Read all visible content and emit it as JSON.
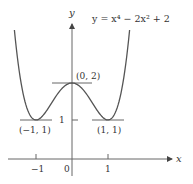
{
  "chart_data": {
    "type": "line",
    "title": "",
    "equation": "y = x⁴ − 2x² + 2",
    "xlabel": "x",
    "ylabel": "y",
    "x_ticks": [
      {
        "value": -1,
        "label": "−1"
      },
      {
        "value": 1,
        "label": "1"
      }
    ],
    "y_ticks": [
      {
        "value": 1,
        "label": "1"
      }
    ],
    "origin_label": "0",
    "xlim": [
      -1.75,
      2.8
    ],
    "ylim": [
      -0.5,
      3.7
    ],
    "grid": false,
    "series": [
      {
        "name": "y = x⁴ − 2x² + 2",
        "function": "x^4 - 2x^2 + 2",
        "domain": [
          -1.6,
          1.6
        ]
      }
    ],
    "annotations": [
      {
        "point": [
          -1,
          1
        ],
        "label": "(−1, 1)",
        "type": "local-minimum",
        "horizontal_tangent": true
      },
      {
        "point": [
          0,
          2
        ],
        "label": "(0, 2)",
        "type": "local-maximum",
        "horizontal_tangent": true
      },
      {
        "point": [
          1,
          1
        ],
        "label": "(1, 1)",
        "type": "local-minimum",
        "horizontal_tangent": true
      }
    ],
    "colors": {
      "curve": "#555555",
      "axes": "#555555",
      "text": "#333333"
    }
  }
}
